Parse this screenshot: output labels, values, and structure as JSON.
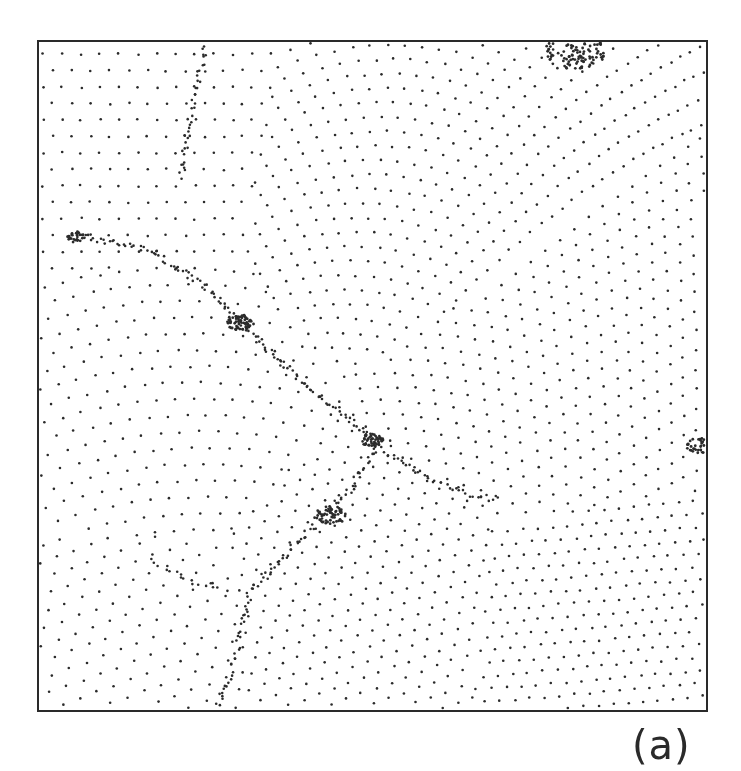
{
  "figure": {
    "panel_label": "(a)",
    "frame": {
      "x": 37,
      "y": 40,
      "width": 671,
      "height": 672
    },
    "colors": {
      "dot": "#2b2b2b",
      "frame": "#2a2a2a",
      "background": "#ffffff"
    },
    "grains": [
      {
        "cx": 100,
        "cy": 120,
        "angle": 0,
        "spacing": 19,
        "curvature": 0.0
      },
      {
        "cx": 420,
        "cy": 180,
        "angle": 12,
        "spacing": 17,
        "curvature": 0.002
      },
      {
        "cx": 130,
        "cy": 420,
        "angle": -8,
        "spacing": 19,
        "curvature": 0.001
      },
      {
        "cx": 560,
        "cy": 380,
        "angle": 25,
        "spacing": 17,
        "curvature": 0.0015
      },
      {
        "cx": 360,
        "cy": 620,
        "angle": 40,
        "spacing": 16,
        "curvature": 0.0
      },
      {
        "cx": 120,
        "cy": 650,
        "angle": -20,
        "spacing": 18,
        "curvature": 0.0
      },
      {
        "cx": 600,
        "cy": 640,
        "angle": 55,
        "spacing": 15,
        "curvature": 0.0
      }
    ],
    "boundaries": [
      {
        "points": [
          [
            205,
            45
          ],
          [
            190,
            120
          ],
          [
            180,
            180
          ]
        ],
        "density": 0.9
      },
      {
        "points": [
          [
            75,
            235
          ],
          [
            150,
            250
          ],
          [
            210,
            290
          ],
          [
            240,
            322
          ]
        ],
        "density": 1.0
      },
      {
        "points": [
          [
            240,
            322
          ],
          [
            300,
            380
          ],
          [
            350,
            420
          ],
          [
            375,
            445
          ]
        ],
        "density": 1.1
      },
      {
        "points": [
          [
            375,
            445
          ],
          [
            420,
            475
          ],
          [
            470,
            495
          ],
          [
            500,
            500
          ]
        ],
        "density": 0.9
      },
      {
        "points": [
          [
            375,
            450
          ],
          [
            350,
            490
          ],
          [
            300,
            540
          ],
          [
            250,
            590
          ]
        ],
        "density": 1.0
      },
      {
        "points": [
          [
            250,
            590
          ],
          [
            240,
            640
          ],
          [
            225,
            690
          ],
          [
            215,
            712
          ]
        ],
        "density": 0.9
      },
      {
        "points": [
          [
            150,
            560
          ],
          [
            190,
            580
          ],
          [
            230,
            590
          ]
        ],
        "density": 0.6
      }
    ],
    "clusters": [
      {
        "x": 240,
        "y": 322,
        "r": 10,
        "n": 60
      },
      {
        "x": 372,
        "y": 440,
        "r": 8,
        "n": 45
      },
      {
        "x": 575,
        "y": 52,
        "r": 22,
        "n": 110
      },
      {
        "x": 700,
        "y": 445,
        "r": 10,
        "n": 40
      },
      {
        "x": 75,
        "y": 237,
        "r": 7,
        "n": 25
      },
      {
        "x": 330,
        "y": 515,
        "r": 12,
        "n": 55
      }
    ]
  }
}
